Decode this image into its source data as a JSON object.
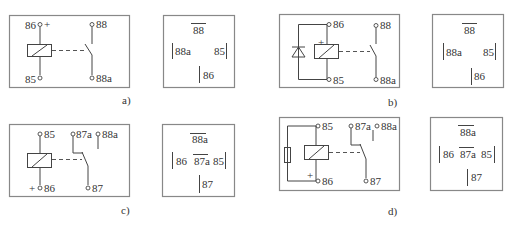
{
  "figure": {
    "panels": [
      {
        "id": "a",
        "caption": "a)",
        "schematic": {
          "coil_top_terminal": "86",
          "coil_top_polarity": "+",
          "coil_bottom_terminal": "85",
          "contact_top_terminal": "88",
          "contact_bottom_terminal": "88a",
          "suppression": "none",
          "contact_type": "make (normally open)"
        },
        "pin_layout": {
          "top": "88",
          "left": "88a",
          "right": "85",
          "bottom": "86",
          "center": ""
        }
      },
      {
        "id": "b",
        "caption": "b)",
        "schematic": {
          "coil_top_terminal": "86",
          "coil_top_polarity": "+",
          "coil_bottom_terminal": "85",
          "contact_top_terminal": "88",
          "contact_bottom_terminal": "88a",
          "suppression": "diode",
          "contact_type": "make (normally open)"
        },
        "pin_layout": {
          "top": "88",
          "left": "88a",
          "right": "85",
          "bottom": "86",
          "center": ""
        }
      },
      {
        "id": "c",
        "caption": "c)",
        "schematic": {
          "coil_top_terminal": "85",
          "coil_bottom_terminal": "86",
          "coil_bottom_polarity": "+",
          "contact_nc_terminal": "87a",
          "contact_extra_terminal": "88a",
          "contact_common_terminal": "87",
          "suppression": "none",
          "contact_type": "changeover"
        },
        "pin_layout": {
          "top": "88a",
          "left": "86",
          "center": "87a",
          "right": "85",
          "bottom": "87"
        }
      },
      {
        "id": "d",
        "caption": "d)",
        "schematic": {
          "coil_top_terminal": "85",
          "coil_bottom_terminal": "86",
          "coil_bottom_polarity": "+",
          "contact_nc_terminal": "87a",
          "contact_extra_terminal": "88a",
          "contact_common_terminal": "87",
          "suppression": "resistor",
          "contact_type": "changeover"
        },
        "pin_layout": {
          "top": "88a",
          "left": "86",
          "center": "87a",
          "right": "85",
          "bottom": "87"
        }
      }
    ]
  }
}
